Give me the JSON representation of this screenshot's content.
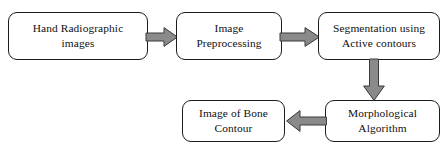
{
  "diagram": {
    "background_color": "#ffffff",
    "box_border_color": "#1d1d1d",
    "arrow_fill_color": "#8a8a8a",
    "arrow_border_color": "#3a3a3a",
    "nodes": [
      {
        "id": "hand-radiographic-images",
        "label": "Hand Radiographic\nimages"
      },
      {
        "id": "image-preprocessing",
        "label": "Image\nPreprocessing"
      },
      {
        "id": "segmentation",
        "label": "Segmentation using\nActive contours"
      },
      {
        "id": "morphological-algorithm",
        "label": "Morphological\nAlgorithm"
      },
      {
        "id": "image-of-bone-contour",
        "label": "Image of Bone\nContour"
      }
    ],
    "arrows": [
      {
        "id": "images-to-preprocessing",
        "direction": "right",
        "from": "hand-radiographic-images",
        "to": "image-preprocessing"
      },
      {
        "id": "preprocessing-to-segmentation",
        "direction": "right",
        "from": "image-preprocessing",
        "to": "segmentation"
      },
      {
        "id": "segmentation-to-morphological",
        "direction": "down",
        "from": "segmentation",
        "to": "morphological-algorithm"
      },
      {
        "id": "morphological-to-contour",
        "direction": "left",
        "from": "morphological-algorithm",
        "to": "image-of-bone-contour"
      }
    ]
  }
}
